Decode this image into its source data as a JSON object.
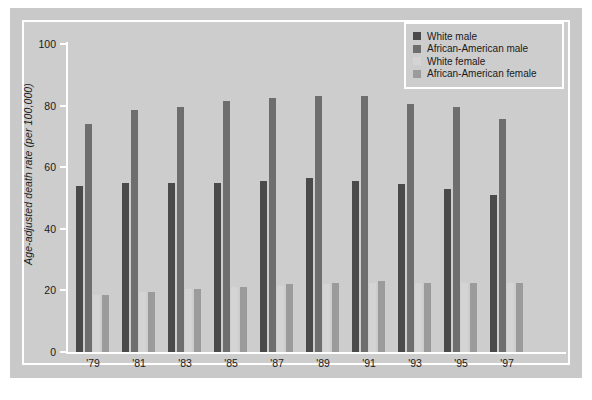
{
  "chart_data": {
    "type": "bar",
    "title": "",
    "xlabel": "",
    "ylabel": "Age-adjusted death rate (per 100,000)",
    "ylim": [
      0,
      100
    ],
    "yticks": [
      0,
      20,
      40,
      60,
      80,
      100
    ],
    "grid": false,
    "legend_position": "top-right",
    "categories": [
      "'79",
      "'81",
      "'83",
      "'85",
      "'87",
      "'89",
      "'91",
      "'93",
      "'95",
      "'97"
    ],
    "series": [
      {
        "name": "White male",
        "color": "#4a4a4a",
        "values": [
          54,
          55,
          55,
          55,
          55.5,
          56.5,
          55.5,
          54.5,
          53,
          51
        ]
      },
      {
        "name": "African-American male",
        "color": "#6e6e6e",
        "values": [
          74,
          78.5,
          79.5,
          81.5,
          82.5,
          83,
          83,
          80.5,
          79.5,
          75.5
        ]
      },
      {
        "name": "White female",
        "color": "#d4d4d4",
        "values": [
          18.5,
          19.5,
          20.5,
          21,
          21.5,
          22,
          22.5,
          22.5,
          22.5,
          22.5
        ]
      },
      {
        "name": "African-American female",
        "color": "#9b9b9b",
        "values": [
          18.5,
          19.5,
          20.5,
          21,
          22,
          22.5,
          23,
          22.5,
          22.5,
          22.5
        ]
      }
    ]
  },
  "legend": {
    "items": [
      {
        "label": "White male"
      },
      {
        "label": "African-American male"
      },
      {
        "label": "White female"
      },
      {
        "label": "African-American female"
      }
    ]
  }
}
